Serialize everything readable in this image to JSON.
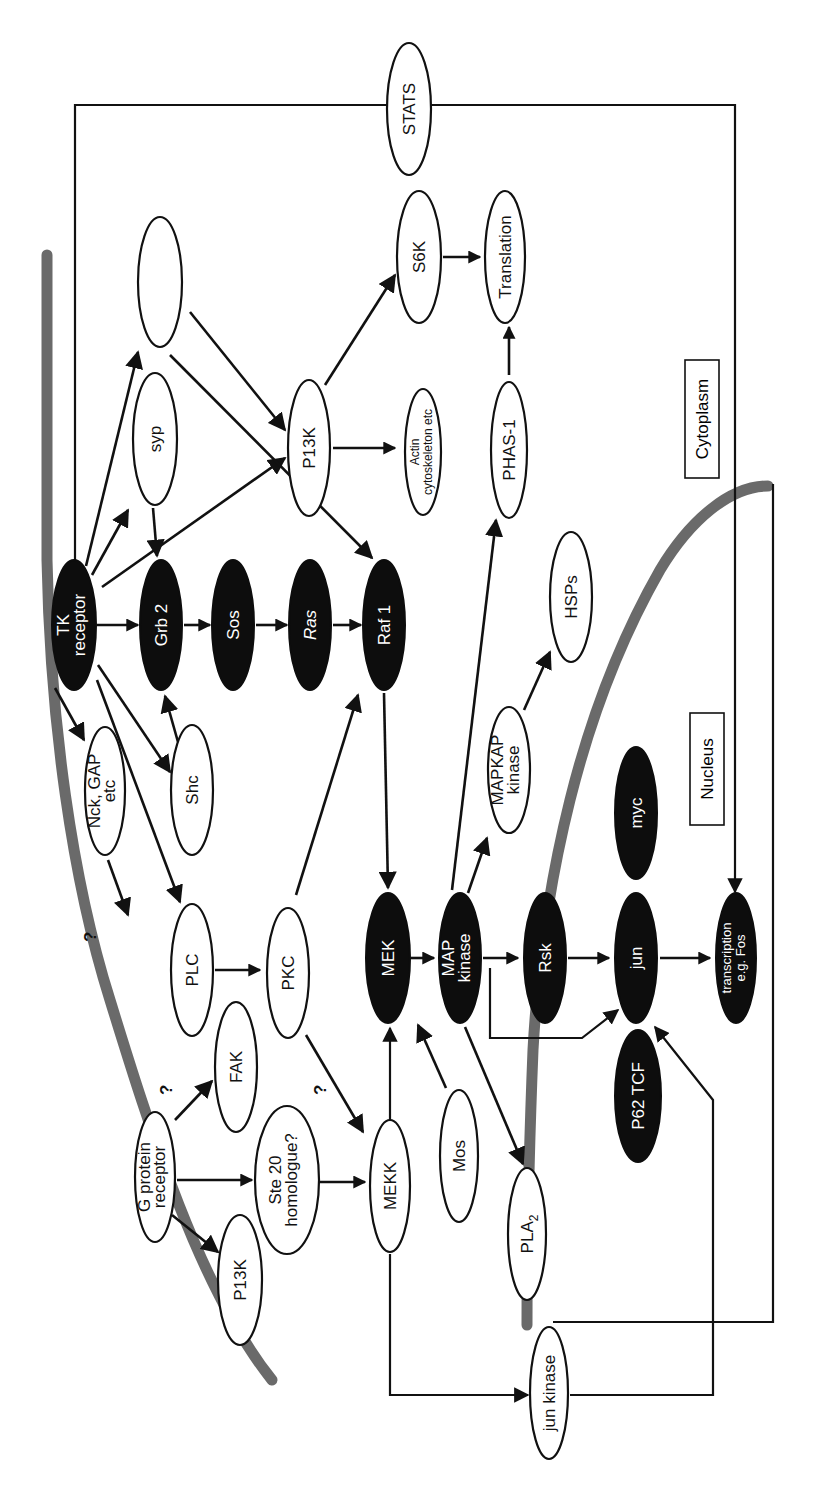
{
  "figure": {
    "orientation": "rotated 90 degrees counter-clockwise (labels read bottom-to-top)",
    "compartments": {
      "cytoplasm_label": "Cytoplasm",
      "nucleus_label": "Nucleus"
    },
    "nodes": {
      "stats": {
        "label": "STATS",
        "style": "light"
      },
      "unlabeled_top": {
        "label": "",
        "style": "light"
      },
      "syp": {
        "label": "syp",
        "style": "light"
      },
      "p13k_top": {
        "label": "P13K",
        "style": "light"
      },
      "s6k": {
        "label": "S6K",
        "style": "light"
      },
      "translation": {
        "label": "Translation",
        "style": "light"
      },
      "actin": {
        "label_line1": "Actin",
        "label_line2": "cytoskeleton etc",
        "style": "light"
      },
      "phas1": {
        "label": "PHAS-1",
        "style": "light"
      },
      "tk_receptor": {
        "label_line1": "TK",
        "label_line2": "receptor",
        "style": "dark"
      },
      "grb2": {
        "label": "Grb 2",
        "style": "dark"
      },
      "sos": {
        "label": "Sos",
        "style": "dark"
      },
      "ras": {
        "label": "Ras",
        "style": "dark"
      },
      "raf1": {
        "label": "Raf 1",
        "style": "dark"
      },
      "hsps": {
        "label": "HSPs",
        "style": "light"
      },
      "nck_gap": {
        "label_line1": "Nck, GAP",
        "label_line2": "etc",
        "style": "light"
      },
      "shc": {
        "label": "Shc",
        "style": "light"
      },
      "mapkap_kinase": {
        "label_line1": "MAPKAP",
        "label_line2": "kinase",
        "style": "light"
      },
      "myc": {
        "label": "myc",
        "style": "dark"
      },
      "plc": {
        "label": "PLC",
        "style": "light"
      },
      "pkc": {
        "label": "PKC",
        "style": "light"
      },
      "mek": {
        "label": "MEK",
        "style": "dark"
      },
      "map_kinase": {
        "label_line1": "MAP",
        "label_line2": "kinase",
        "style": "dark"
      },
      "rsk": {
        "label": "Rsk",
        "style": "dark"
      },
      "jun": {
        "label": "jun",
        "style": "dark"
      },
      "transcription": {
        "label_line1": "transcription",
        "label_line2": "e.g. Fos",
        "style": "dark"
      },
      "fak": {
        "label": "FAK",
        "style": "light"
      },
      "g_protein_receptor": {
        "label_line1": "G protein",
        "label_line2": "receptor",
        "style": "light"
      },
      "p13k_bottom": {
        "label": "P13K",
        "style": "light"
      },
      "ste20": {
        "label_line1": "Ste 20",
        "label_line2": "homologue?",
        "style": "light"
      },
      "mekk": {
        "label": "MEKK",
        "style": "light"
      },
      "mos": {
        "label": "Mos",
        "style": "light"
      },
      "pla2": {
        "label": "PLA",
        "subscript": "2",
        "style": "light"
      },
      "p62_tcf": {
        "label": "P62 TCF",
        "style": "dark"
      },
      "jun_kinase": {
        "label": "jun kinase",
        "style": "light"
      }
    },
    "annotations": {
      "q1": "?",
      "q2": "?",
      "q3": "?"
    },
    "edges": [
      {
        "from": "TK receptor",
        "to": "Grb 2"
      },
      {
        "from": "Grb 2",
        "to": "Sos"
      },
      {
        "from": "Sos",
        "to": "Ras"
      },
      {
        "from": "Ras",
        "to": "Raf 1"
      },
      {
        "from": "TK receptor",
        "to": "unlabeled_top"
      },
      {
        "from": "TK receptor",
        "to": "syp"
      },
      {
        "from": "TK receptor",
        "to": "P13K"
      },
      {
        "from": "TK receptor",
        "to": "Nck, GAP etc"
      },
      {
        "from": "TK receptor",
        "to": "Shc"
      },
      {
        "from": "TK receptor",
        "to": "PLC"
      },
      {
        "from": "TK receptor",
        "to": "STATS"
      },
      {
        "from": "syp",
        "to": "Grb 2"
      },
      {
        "from": "Shc",
        "to": "Grb 2"
      },
      {
        "from": "unlabeled_top",
        "to": "P13K"
      },
      {
        "from": "unlabeled_top",
        "to": "Raf 1"
      },
      {
        "from": "P13K",
        "to": "S6K"
      },
      {
        "from": "P13K",
        "to": "Actin cytoskeleton etc"
      },
      {
        "from": "S6K",
        "to": "Translation"
      },
      {
        "from": "PHAS-1",
        "to": "Translation"
      },
      {
        "from": "Nck, GAP etc",
        "to": "?"
      },
      {
        "from": "PLC",
        "to": "PKC"
      },
      {
        "from": "PKC",
        "to": "Raf 1"
      },
      {
        "from": "PKC",
        "to": "MEKK",
        "label": "?"
      },
      {
        "from": "Raf 1",
        "to": "MEK"
      },
      {
        "from": "MEK",
        "to": "MAP kinase"
      },
      {
        "from": "MAP kinase",
        "to": "Rsk"
      },
      {
        "from": "MAP kinase",
        "to": "MAPKAP kinase"
      },
      {
        "from": "MAP kinase",
        "to": "PHAS-1"
      },
      {
        "from": "MAP kinase",
        "to": "PLA2"
      },
      {
        "from": "MAP kinase",
        "to": "jun"
      },
      {
        "from": "MAPKAP kinase",
        "to": "HSPs"
      },
      {
        "from": "Rsk",
        "to": "jun"
      },
      {
        "from": "jun",
        "to": "transcription e.g. Fos"
      },
      {
        "from": "STATS",
        "to": "transcription e.g. Fos"
      },
      {
        "from": "G protein receptor",
        "to": "FAK",
        "label": "?"
      },
      {
        "from": "G protein receptor",
        "to": "Ste 20 homologue?"
      },
      {
        "from": "G protein receptor",
        "to": "P13K"
      },
      {
        "from": "Ste 20 homologue?",
        "to": "MEKK"
      },
      {
        "from": "MEKK",
        "to": "MEK"
      },
      {
        "from": "Mos",
        "to": "MAP kinase"
      },
      {
        "from": "MEKK",
        "to": "jun kinase"
      },
      {
        "from": "jun kinase",
        "to": "jun"
      }
    ]
  }
}
